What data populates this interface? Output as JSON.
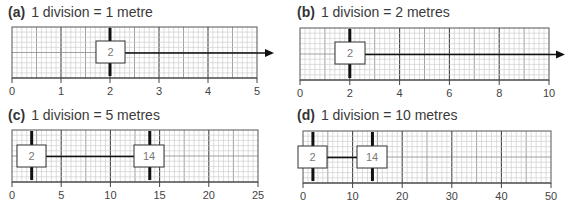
{
  "panels": [
    {
      "id": "a",
      "label": "(a)",
      "caption": "1 division = 1 metre",
      "title_pos": [
        8,
        4
      ],
      "grid": {
        "x0": 12,
        "x1": 257,
        "y0": 27,
        "y1": 78
      },
      "axis": {
        "min": 0,
        "max": 5,
        "ticks": [
          0,
          1,
          2,
          3,
          4,
          5
        ],
        "tick_labels": [
          "0",
          "1",
          "2",
          "3",
          "4",
          "5"
        ]
      },
      "boxes": [
        {
          "value": 2,
          "label": "2",
          "x": 96,
          "y": 41,
          "w": 29,
          "h": 22
        }
      ],
      "connector": {
        "type": "arrow",
        "from_x": 125,
        "to_x": 274
      }
    },
    {
      "id": "b",
      "label": "(b)",
      "caption": "1 division = 2 metres",
      "title_pos": [
        297,
        4
      ],
      "grid": {
        "x0": 300,
        "x1": 549,
        "y0": 28,
        "y1": 80
      },
      "axis": {
        "min": 0,
        "max": 10,
        "ticks": [
          0,
          2,
          4,
          6,
          8,
          10
        ],
        "tick_labels": [
          "0",
          "2",
          "4",
          "6",
          "8",
          "10"
        ]
      },
      "boxes": [
        {
          "value": 2,
          "label": "2",
          "x": 335,
          "y": 42,
          "w": 30,
          "h": 22
        }
      ],
      "connector": {
        "type": "arrow",
        "from_x": 365,
        "to_x": 565
      }
    },
    {
      "id": "c",
      "label": "(c)",
      "caption": "1 division = 5 metres",
      "title_pos": [
        8,
        107
      ],
      "grid": {
        "x0": 12,
        "x1": 258,
        "y0": 130,
        "y1": 182
      },
      "axis": {
        "min": 0,
        "max": 25,
        "ticks": [
          0,
          5,
          10,
          15,
          20,
          25
        ],
        "tick_labels": [
          "0",
          "5",
          "10",
          "15",
          "20",
          "25"
        ]
      },
      "boxes": [
        {
          "value": 2,
          "label": "2",
          "x": 17,
          "y": 145,
          "w": 29,
          "h": 22
        },
        {
          "value": 14,
          "label": "14",
          "x": 134,
          "y": 145,
          "w": 30,
          "h": 22
        }
      ],
      "connector": {
        "type": "line",
        "from_x": 46,
        "to_x": 134
      }
    },
    {
      "id": "d",
      "label": "(d)",
      "caption": "1 division = 10 metres",
      "title_pos": [
        297,
        107
      ],
      "grid": {
        "x0": 303,
        "x1": 551,
        "y0": 131,
        "y1": 183
      },
      "axis": {
        "min": 0,
        "max": 50,
        "ticks": [
          0,
          10,
          20,
          30,
          40,
          50
        ],
        "tick_labels": [
          "0",
          "10",
          "20",
          "30",
          "40",
          "50"
        ]
      },
      "boxes": [
        {
          "value": 2,
          "label": "2",
          "x": 298,
          "y": 146,
          "w": 29,
          "h": 22
        },
        {
          "value": 14,
          "label": "14",
          "x": 357,
          "y": 146,
          "w": 30,
          "h": 22
        }
      ],
      "connector": {
        "type": "line",
        "from_x": 327,
        "to_x": 357
      }
    }
  ],
  "colors": {
    "minor_grid": "#c8c8c8",
    "mid_grid": "#8a8a8a",
    "major_grid": "#444444",
    "frame": "#555555",
    "ink": "#111111",
    "box_fill": "#ffffff",
    "box_stroke": "#333333"
  }
}
